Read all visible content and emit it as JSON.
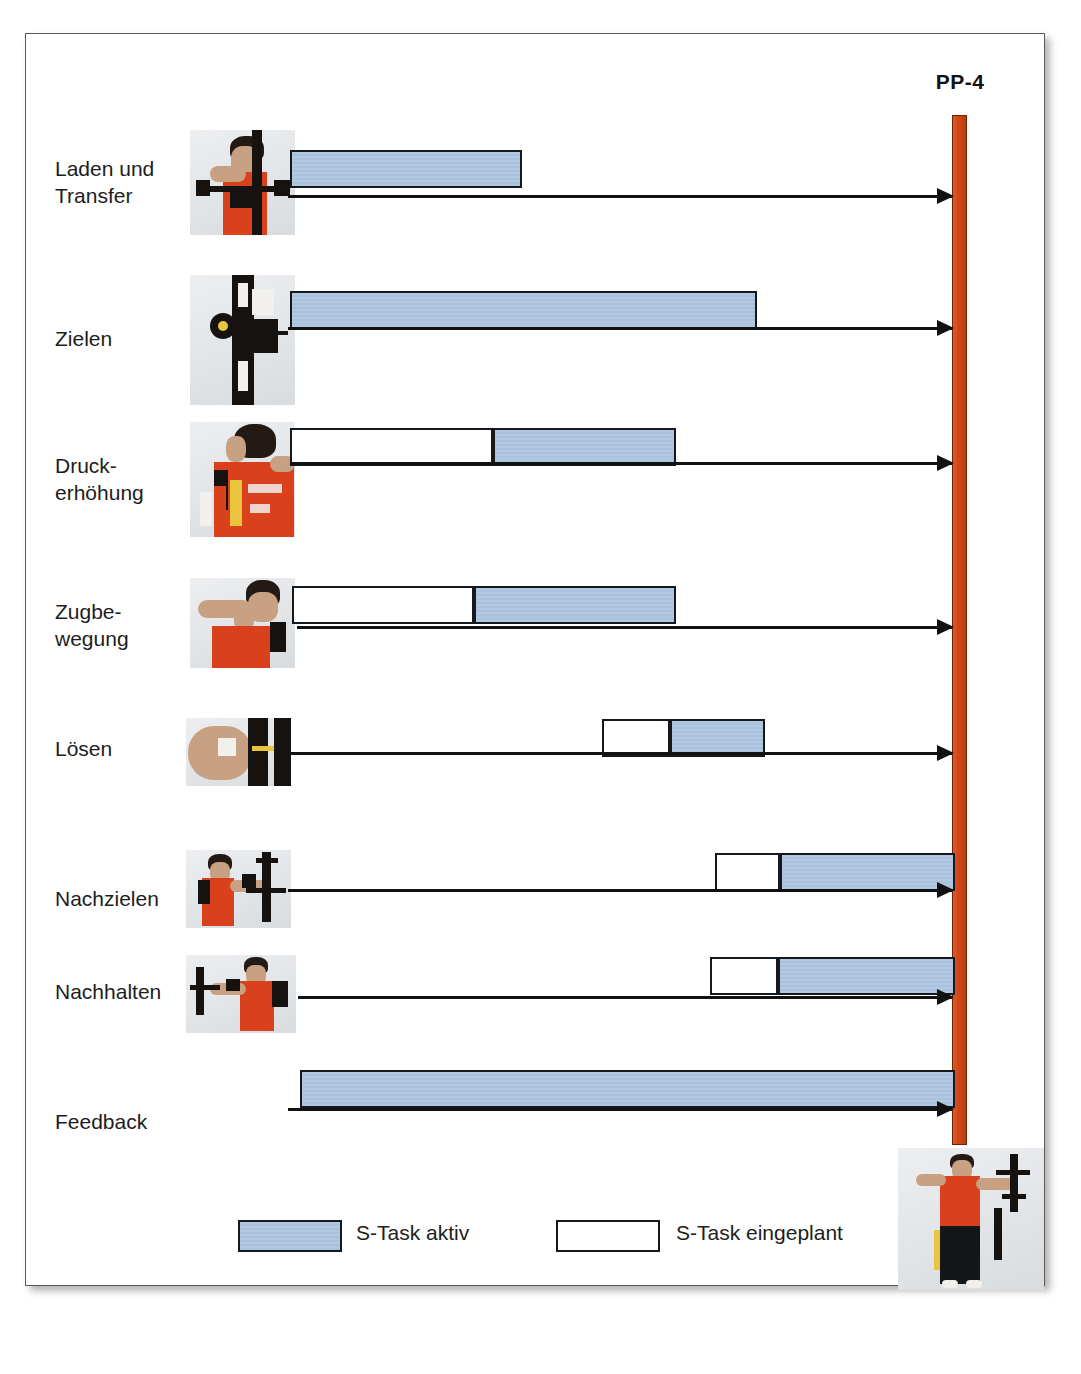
{
  "diagram": {
    "milestone": {
      "label": "PP-4",
      "color": "#cf4516"
    },
    "legend": {
      "active_label": "S-Task aktiv",
      "planned_label": "S-Task eingeplant",
      "active_color": "#aec6e0",
      "planned_color": "#ffffff"
    },
    "rows": [
      {
        "label": "Laden und\nTransfer",
        "photo": "archer-loading-transfer-photo"
      },
      {
        "label": "Zielen",
        "photo": "bow-sight-aiming-photo"
      },
      {
        "label": "Druck-\nerhöhung",
        "photo": "archer-back-pressure-photo"
      },
      {
        "label": "Zugbe-\nwegung",
        "photo": "archer-draw-movement-photo"
      },
      {
        "label": "Lösen",
        "photo": "release-hand-photo"
      },
      {
        "label": "Nachzielen",
        "photo": "archer-follow-aim-photo"
      },
      {
        "label": "Nachhalten",
        "photo": "archer-follow-through-photo"
      },
      {
        "label": "Feedback",
        "photo": ""
      }
    ],
    "bottom_photo": "archer-full-body-photo"
  },
  "chart_data": {
    "type": "bar",
    "title": "PP-4",
    "xlabel": "",
    "ylabel": "",
    "categories": [
      "Laden und Transfer",
      "Zielen",
      "Druckerhöhung",
      "Zugbewegung",
      "Lösen",
      "Nachzielen",
      "Nachhalten",
      "Feedback"
    ],
    "x_axis_px": [
      25,
      1045
    ],
    "milestone_x_px": 952,
    "legend": [
      "S-Task aktiv",
      "S-Task eingeplant"
    ],
    "grid": false,
    "series": [
      {
        "name": "S-Task eingeplant",
        "segments": [
          null,
          null,
          [
            290,
            493
          ],
          [
            292,
            474
          ],
          [
            602,
            670
          ],
          [
            715,
            780
          ],
          [
            710,
            778
          ],
          null
        ]
      },
      {
        "name": "S-Task aktiv",
        "segments": [
          [
            290,
            522
          ],
          [
            290,
            757
          ],
          [
            493,
            676
          ],
          [
            474,
            676
          ],
          [
            670,
            765
          ],
          [
            780,
            955
          ],
          [
            778,
            955
          ],
          [
            300,
            955
          ]
        ]
      }
    ],
    "arrows": [
      {
        "category": "Laden und Transfer",
        "from_px": 288,
        "to_px": 952
      },
      {
        "category": "Zielen",
        "from_px": 288,
        "to_px": 952
      },
      {
        "category": "Druckerhöhung",
        "from_px": 290,
        "to_px": 952
      },
      {
        "category": "Zugbewegung",
        "from_px": 297,
        "to_px": 952
      },
      {
        "category": "Lösen",
        "from_px": 287,
        "to_px": 952
      },
      {
        "category": "Nachzielen",
        "from_px": 288,
        "to_px": 952
      },
      {
        "category": "Nachhalten",
        "from_px": 298,
        "to_px": 952
      },
      {
        "category": "Feedback",
        "from_px": 288,
        "to_px": 952
      }
    ]
  }
}
